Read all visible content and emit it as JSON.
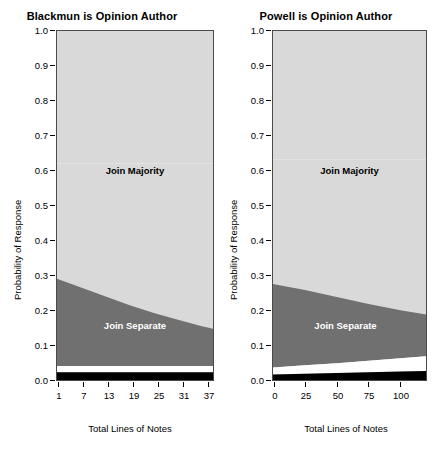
{
  "figure": {
    "background": "#ffffff",
    "width": 432,
    "height": 454
  },
  "colors": {
    "join_majority": "#d9d9d9",
    "join_separate": "#707070",
    "band_white": "#ffffff",
    "band_black": "#000000",
    "axis": "#000000",
    "plot_border": "#4a4a4a",
    "label_majority_text": "#000000",
    "label_separate_text": "#ffffff"
  },
  "axes": {
    "ylabel": "Probability of Response",
    "xlabel": "Total Lines of Notes",
    "ytick_labels": [
      "1.0",
      "0.9",
      "0.8",
      "0.7",
      "0.6",
      "0.5",
      "0.4",
      "0.3",
      "0.2",
      "0.1",
      "0.0"
    ]
  },
  "region_labels": {
    "majority": "Join Majority",
    "separate": "Join Separate"
  },
  "panels": [
    {
      "id": "blackmun",
      "title": "Blackmun is Opinion Author",
      "xtick_labels": [
        "1",
        "7",
        "13",
        "19",
        "25",
        "31",
        "37"
      ]
    },
    {
      "id": "powell",
      "title": "Powell is Opinion Author",
      "xtick_labels": [
        "0",
        "25",
        "50",
        "75",
        "100"
      ]
    }
  ],
  "chart_data": {
    "type": "area",
    "ylabel": "Probability of Response",
    "xlabel": "Total Lines of Notes",
    "ylim": [
      0.0,
      1.0
    ],
    "ygrid": false,
    "legend": "inline-region-labels",
    "stacking": "cumulative-from-bottom",
    "categories_order": [
      "Other (black)",
      "White band",
      "Join Separate",
      "Join Majority"
    ],
    "panels": [
      {
        "name": "Blackmun is Opinion Author",
        "xlabel": "Total Lines of Notes",
        "xlim": [
          1,
          40
        ],
        "xticks": [
          1,
          7,
          13,
          19,
          25,
          31,
          37
        ],
        "x": [
          1,
          7,
          13,
          19,
          25,
          31,
          37,
          40
        ],
        "series": [
          {
            "name": "Other (black)",
            "cumulative_upper": [
              0.022,
              0.022,
              0.022,
              0.022,
              0.022,
              0.022,
              0.022,
              0.022
            ]
          },
          {
            "name": "White band",
            "cumulative_upper": [
              0.04,
              0.04,
              0.04,
              0.04,
              0.04,
              0.04,
              0.04,
              0.04
            ]
          },
          {
            "name": "Join Separate",
            "cumulative_upper": [
              0.29,
              0.265,
              0.24,
              0.215,
              0.193,
              0.173,
              0.155,
              0.147
            ]
          },
          {
            "name": "Join Majority",
            "cumulative_upper": [
              1.0,
              1.0,
              1.0,
              1.0,
              1.0,
              1.0,
              1.0,
              1.0
            ]
          }
        ]
      },
      {
        "name": "Powell is Opinion Author",
        "xlabel": "Total Lines of Notes",
        "xlim": [
          0,
          120
        ],
        "xticks": [
          0,
          25,
          50,
          75,
          100
        ],
        "x": [
          0,
          25,
          50,
          75,
          100,
          120
        ],
        "series": [
          {
            "name": "Other (black)",
            "cumulative_upper": [
              0.016,
              0.018,
              0.02,
              0.022,
              0.024,
              0.026
            ]
          },
          {
            "name": "White band",
            "cumulative_upper": [
              0.036,
              0.042,
              0.048,
              0.055,
              0.062,
              0.068
            ]
          },
          {
            "name": "Join Separate",
            "cumulative_upper": [
              0.275,
              0.258,
              0.238,
              0.218,
              0.2,
              0.188
            ]
          },
          {
            "name": "Join Majority",
            "cumulative_upper": [
              1.0,
              1.0,
              1.0,
              1.0,
              1.0,
              1.0
            ]
          }
        ]
      }
    ]
  }
}
